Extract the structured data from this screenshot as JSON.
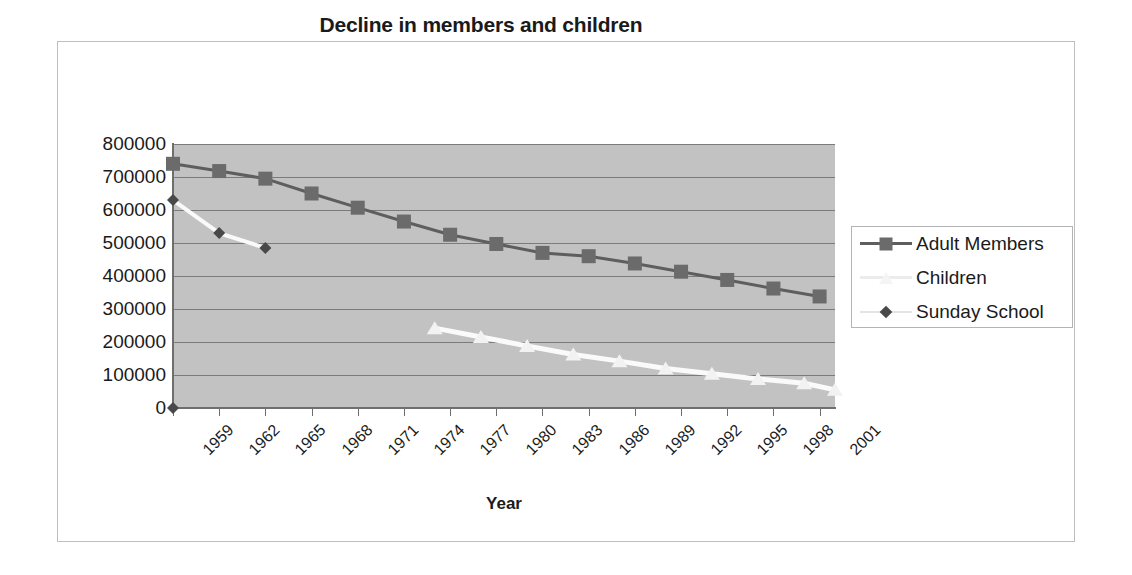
{
  "chart_data": {
    "type": "line",
    "title": "Decline in members and children",
    "xlabel": "Year",
    "ylabel": "",
    "grid": true,
    "legend_position": "right",
    "xlim": [
      1959,
      2002
    ],
    "ylim": [
      0,
      800000
    ],
    "ytick_labels": [
      "800000",
      "700000",
      "600000",
      "500000",
      "400000",
      "300000",
      "200000",
      "100000",
      "0"
    ],
    "ytick_values": [
      800000,
      700000,
      600000,
      500000,
      400000,
      300000,
      200000,
      100000,
      0
    ],
    "xtick_labels": [
      "1959",
      "1962",
      "1965",
      "1968",
      "1971",
      "1974",
      "1977",
      "1980",
      "1983",
      "1986",
      "1989",
      "1992",
      "1995",
      "1998",
      "2001"
    ],
    "xtick_values": [
      1959,
      1962,
      1965,
      1968,
      1971,
      1974,
      1977,
      1980,
      1983,
      1986,
      1989,
      1992,
      1995,
      1998,
      2001
    ],
    "series": [
      {
        "name": "Adult Members",
        "marker": "square",
        "color": "#6b6b6b",
        "line_color": "#5e5e5e",
        "x": [
          1959,
          1962,
          1965,
          1968,
          1971,
          1974,
          1977,
          1980,
          1983,
          1986,
          1989,
          1992,
          1995,
          1998,
          2001
        ],
        "values": [
          740000,
          718000,
          695000,
          650000,
          607000,
          565000,
          525000,
          497000,
          470000,
          460000,
          438000,
          413000,
          388000,
          362000,
          338000
        ]
      },
      {
        "name": "Children",
        "marker": "triangle",
        "color": "#f2f2f2",
        "line_color": "#fafafa",
        "x": [
          1976,
          1979,
          1982,
          1985,
          1988,
          1991,
          1994,
          1997,
          2000,
          2002
        ],
        "values": [
          242000,
          215000,
          188000,
          162000,
          142000,
          120000,
          104000,
          88000,
          75000,
          55000
        ]
      },
      {
        "name": "Sunday School",
        "marker": "diamond",
        "color": "#494949",
        "line_color": "#fafafa",
        "x": [
          1959,
          1962,
          1965
        ],
        "values": [
          630000,
          530000,
          485000
        ],
        "baseline_point": {
          "x": 1959,
          "value": 0
        }
      }
    ]
  },
  "legend": {
    "items": [
      {
        "label": "Adult Members"
      },
      {
        "label": "Children"
      },
      {
        "label": "Sunday School"
      }
    ]
  },
  "colors": {
    "plot_background": "#c2c2c2",
    "gridline": "#7b7b7b",
    "axis": "#6e6e6e",
    "frame_border": "#bfbfbf",
    "text": "#1a1a1a"
  }
}
